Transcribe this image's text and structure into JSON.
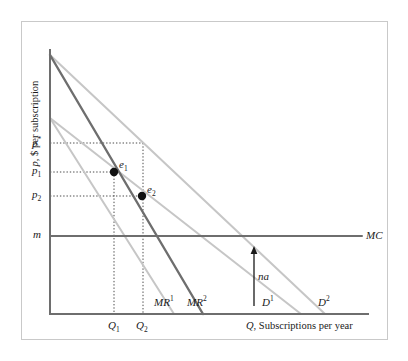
{
  "chart_data": {
    "type": "line",
    "title": "",
    "xlabel": "Q, Subscriptions per year",
    "ylabel": "p, $ per subscription",
    "grid": false,
    "legend": "inline-curve-labels",
    "xlim": [
      0,
      1
    ],
    "ylim": [
      0,
      1
    ],
    "y_ticks": [
      {
        "label": "p*",
        "base": "p",
        "sup": "*",
        "value": 0.536
      },
      {
        "label": "p1",
        "base": "p",
        "sub": "1",
        "value": 0.446
      },
      {
        "label": "p2",
        "base": "p",
        "sub": "2",
        "value": 0.37
      },
      {
        "label": "m",
        "base": "m",
        "value": 0.245
      }
    ],
    "x_ticks": [
      {
        "label": "Q1",
        "base": "Q",
        "sub": "1",
        "value": 0.19
      },
      {
        "label": "Q2",
        "base": "Q",
        "sub": "2",
        "value": 0.273
      }
    ],
    "series": [
      {
        "name": "D1",
        "base": "D",
        "sup": "1",
        "label_text": "D",
        "kind": "demand",
        "color": "#c6c6c6",
        "points": [
          [
            0.0,
            0.7
          ],
          [
            0.772,
            0.0
          ]
        ]
      },
      {
        "name": "D2",
        "base": "D",
        "sup": "2",
        "label_text": "D",
        "kind": "demand",
        "color": "#c6c6c6",
        "points": [
          [
            0.0,
            0.94
          ],
          [
            0.845,
            0.0
          ]
        ]
      },
      {
        "name": "MR1",
        "base": "MR",
        "sup": "1",
        "label_text": "MR",
        "kind": "marginal-revenue",
        "color": "#c6c6c6",
        "points": [
          [
            0.0,
            0.7
          ],
          [
            0.382,
            0.0
          ]
        ]
      },
      {
        "name": "MR2",
        "base": "MR",
        "sup": "2",
        "label_text": "MR",
        "kind": "marginal-revenue",
        "color": "#6e6e6e",
        "points": [
          [
            0.0,
            0.94
          ],
          [
            0.47,
            0.0
          ]
        ]
      },
      {
        "name": "MC",
        "base": "MC",
        "label_text": "MC",
        "kind": "marginal-cost",
        "color": "#6e6e6e",
        "points": [
          [
            0.0,
            0.245
          ],
          [
            1.0,
            0.245
          ]
        ]
      }
    ],
    "points": [
      {
        "name": "e1",
        "base": "e",
        "sub": "1",
        "x": 0.19,
        "y": 0.446
      },
      {
        "name": "e2",
        "base": "e",
        "sub": "2",
        "x": 0.273,
        "y": 0.37
      }
    ],
    "annotations": [
      {
        "name": "na",
        "text": "na",
        "kind": "vertical-arrow",
        "x": 0.622,
        "y_from": 0.04,
        "y_to": 0.215
      }
    ],
    "curve_labels": [
      {
        "name": "MR1",
        "base": "MR",
        "sup": "1"
      },
      {
        "name": "MR2",
        "base": "MR",
        "sup": "2"
      },
      {
        "name": "D1",
        "base": "D",
        "sup": "1"
      },
      {
        "name": "D2",
        "base": "D",
        "sup": "2"
      },
      {
        "name": "MC",
        "base": "MC"
      }
    ],
    "colors": {
      "axis": "#6e6e6e",
      "light_curve": "#c6c6c6",
      "dark_curve": "#6e6e6e",
      "dotted_guide": "#4a4a4a",
      "point_marker": "#111111",
      "frame_border": "#c9c9c9",
      "text": "#1a1a1a"
    }
  }
}
